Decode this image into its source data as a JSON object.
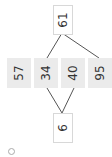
{
  "diagram": {
    "top_node": "61",
    "bottom_node": "6",
    "cells": [
      "57",
      "34",
      "40",
      "95"
    ],
    "edges": [
      {
        "from": "top_node",
        "to": "34"
      },
      {
        "from": "top_node",
        "to": "95"
      },
      {
        "from": "bottom_node",
        "to": "34"
      },
      {
        "from": "bottom_node",
        "to": "40"
      }
    ],
    "colors": {
      "cell_bg": "#ebebeb",
      "line": "#555555",
      "box_border": "#d8d8d8"
    }
  },
  "footer": {
    "icon": "settings-circle-icon"
  }
}
